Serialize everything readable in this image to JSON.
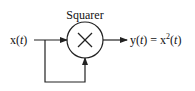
{
  "block": {
    "label": "Squarer",
    "symbol": "×",
    "operation": "multiplier"
  },
  "input": {
    "label_main": "x(",
    "label_var": "t",
    "label_end": ")"
  },
  "output": {
    "y": "y(",
    "t1": "t",
    "mid": ") = x",
    "sup": "2",
    "open": "(",
    "t2": "t",
    "close": ")"
  }
}
